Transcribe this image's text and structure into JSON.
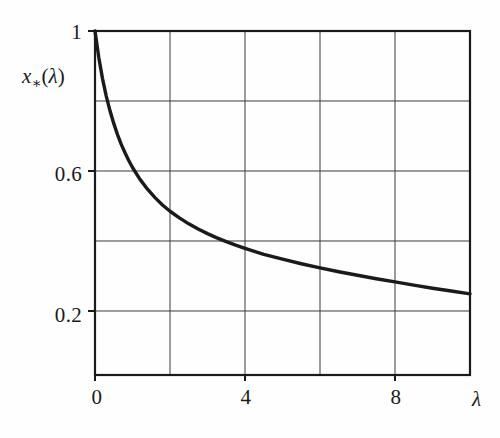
{
  "chart_data": {
    "type": "line",
    "title": "",
    "xlabel": "λ",
    "ylabel": "x∗(λ)",
    "xlim": [
      0,
      10
    ],
    "ylim": [
      0.0171,
      1.0
    ],
    "grid": true,
    "legend": null,
    "x_ticks": [
      {
        "value": 0,
        "label": "0"
      },
      {
        "value": 4,
        "label": "4"
      },
      {
        "value": 8,
        "label": "8"
      }
    ],
    "x_gridlines": [
      0,
      2,
      4,
      6,
      8,
      10
    ],
    "y_ticks": [
      {
        "value": 1.0,
        "label": "1"
      },
      {
        "value": 0.6,
        "label": "0.6"
      },
      {
        "value": 0.2,
        "label": "0.2"
      }
    ],
    "y_gridlines": [
      1.0,
      0.8,
      0.6,
      0.4,
      0.2
    ],
    "series": [
      {
        "name": "x*(λ)",
        "color": "#1a1a1a",
        "x": [
          0.0,
          0.1,
          0.2,
          0.3,
          0.4,
          0.5,
          0.6,
          0.7,
          0.8,
          0.9,
          1.0,
          1.2,
          1.4,
          1.6,
          1.8,
          2.0,
          2.25,
          2.5,
          2.75,
          3.0,
          3.25,
          3.5,
          3.75,
          4.0,
          4.5,
          5.0,
          5.5,
          6.0,
          6.5,
          7.0,
          7.5,
          8.0,
          8.5,
          9.0,
          9.5,
          10.0
        ],
        "values": [
          1.0,
          0.925,
          0.864,
          0.814,
          0.772,
          0.736,
          0.704,
          0.676,
          0.652,
          0.63,
          0.61,
          0.576,
          0.548,
          0.524,
          0.503,
          0.485,
          0.466,
          0.449,
          0.434,
          0.421,
          0.409,
          0.398,
          0.388,
          0.379,
          0.362,
          0.348,
          0.335,
          0.323,
          0.312,
          0.302,
          0.292,
          0.283,
          0.274,
          0.265,
          0.257,
          0.249
        ]
      }
    ]
  },
  "annotations": {
    "curve_endpoint_note": "",
    "axis_arrow": false
  }
}
